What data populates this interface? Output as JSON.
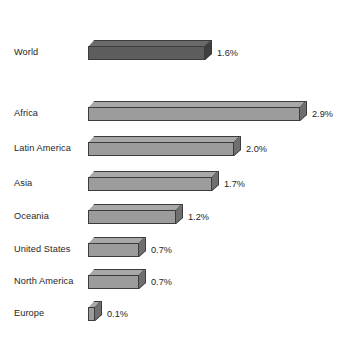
{
  "chart_data": {
    "type": "bar",
    "orientation": "horizontal",
    "title": "",
    "subtitle": "",
    "xlabel": "",
    "ylabel": "",
    "grid": false,
    "legend": "none",
    "axis_visible": false,
    "value_suffix": "%",
    "xlim": [
      0,
      2.9
    ],
    "px_per_unit": 73,
    "categories": [
      "World",
      "Africa",
      "Latin America",
      "Asia",
      "Oceania",
      "United States",
      "North America",
      "Europe"
    ],
    "values": [
      1.6,
      2.9,
      2.0,
      1.7,
      1.2,
      0.7,
      0.7,
      0.1
    ],
    "value_labels": [
      "1.6%",
      "2.9%",
      "2.0%",
      "1.7%",
      "1.2%",
      "0.7%",
      "0.7%",
      "0.1%"
    ],
    "series": [
      {
        "name": "Annual growth rate",
        "values": [
          1.6,
          2.9,
          2.0,
          1.7,
          1.2,
          0.7,
          0.7,
          0.1
        ]
      }
    ],
    "bars": [
      {
        "category": "World",
        "value": 1.6,
        "label": "1.6%",
        "highlight": true,
        "top": 40,
        "color": "#5d5d5d"
      },
      {
        "category": "Africa",
        "value": 2.9,
        "label": "2.9%",
        "highlight": false,
        "top": 101,
        "color": "#9c9c9c"
      },
      {
        "category": "Latin America",
        "value": 2.0,
        "label": "2.0%",
        "highlight": false,
        "top": 136,
        "color": "#9c9c9c"
      },
      {
        "category": "Asia",
        "value": 1.7,
        "label": "1.7%",
        "highlight": false,
        "top": 171,
        "color": "#9c9c9c"
      },
      {
        "category": "Oceania",
        "value": 1.2,
        "label": "1.2%",
        "highlight": false,
        "top": 204,
        "color": "#9c9c9c"
      },
      {
        "category": "United States",
        "value": 0.7,
        "label": "0.7%",
        "highlight": false,
        "top": 237,
        "color": "#9c9c9c"
      },
      {
        "category": "North America",
        "value": 0.7,
        "label": "0.7%",
        "highlight": false,
        "top": 269,
        "color": "#9c9c9c"
      },
      {
        "category": "Europe",
        "value": 0.1,
        "label": "0.1%",
        "highlight": false,
        "top": 301,
        "color": "#9c9c9c"
      }
    ],
    "colors": {
      "background": "#ffffff",
      "bar_fill": "#9c9c9c",
      "bar_fill_highlight": "#5d5d5d",
      "bar_top": "#a8a8a8",
      "bar_side": "#6f6f6f",
      "bar_outline": "#3c3c3c",
      "text": "#1e1e1e"
    }
  }
}
